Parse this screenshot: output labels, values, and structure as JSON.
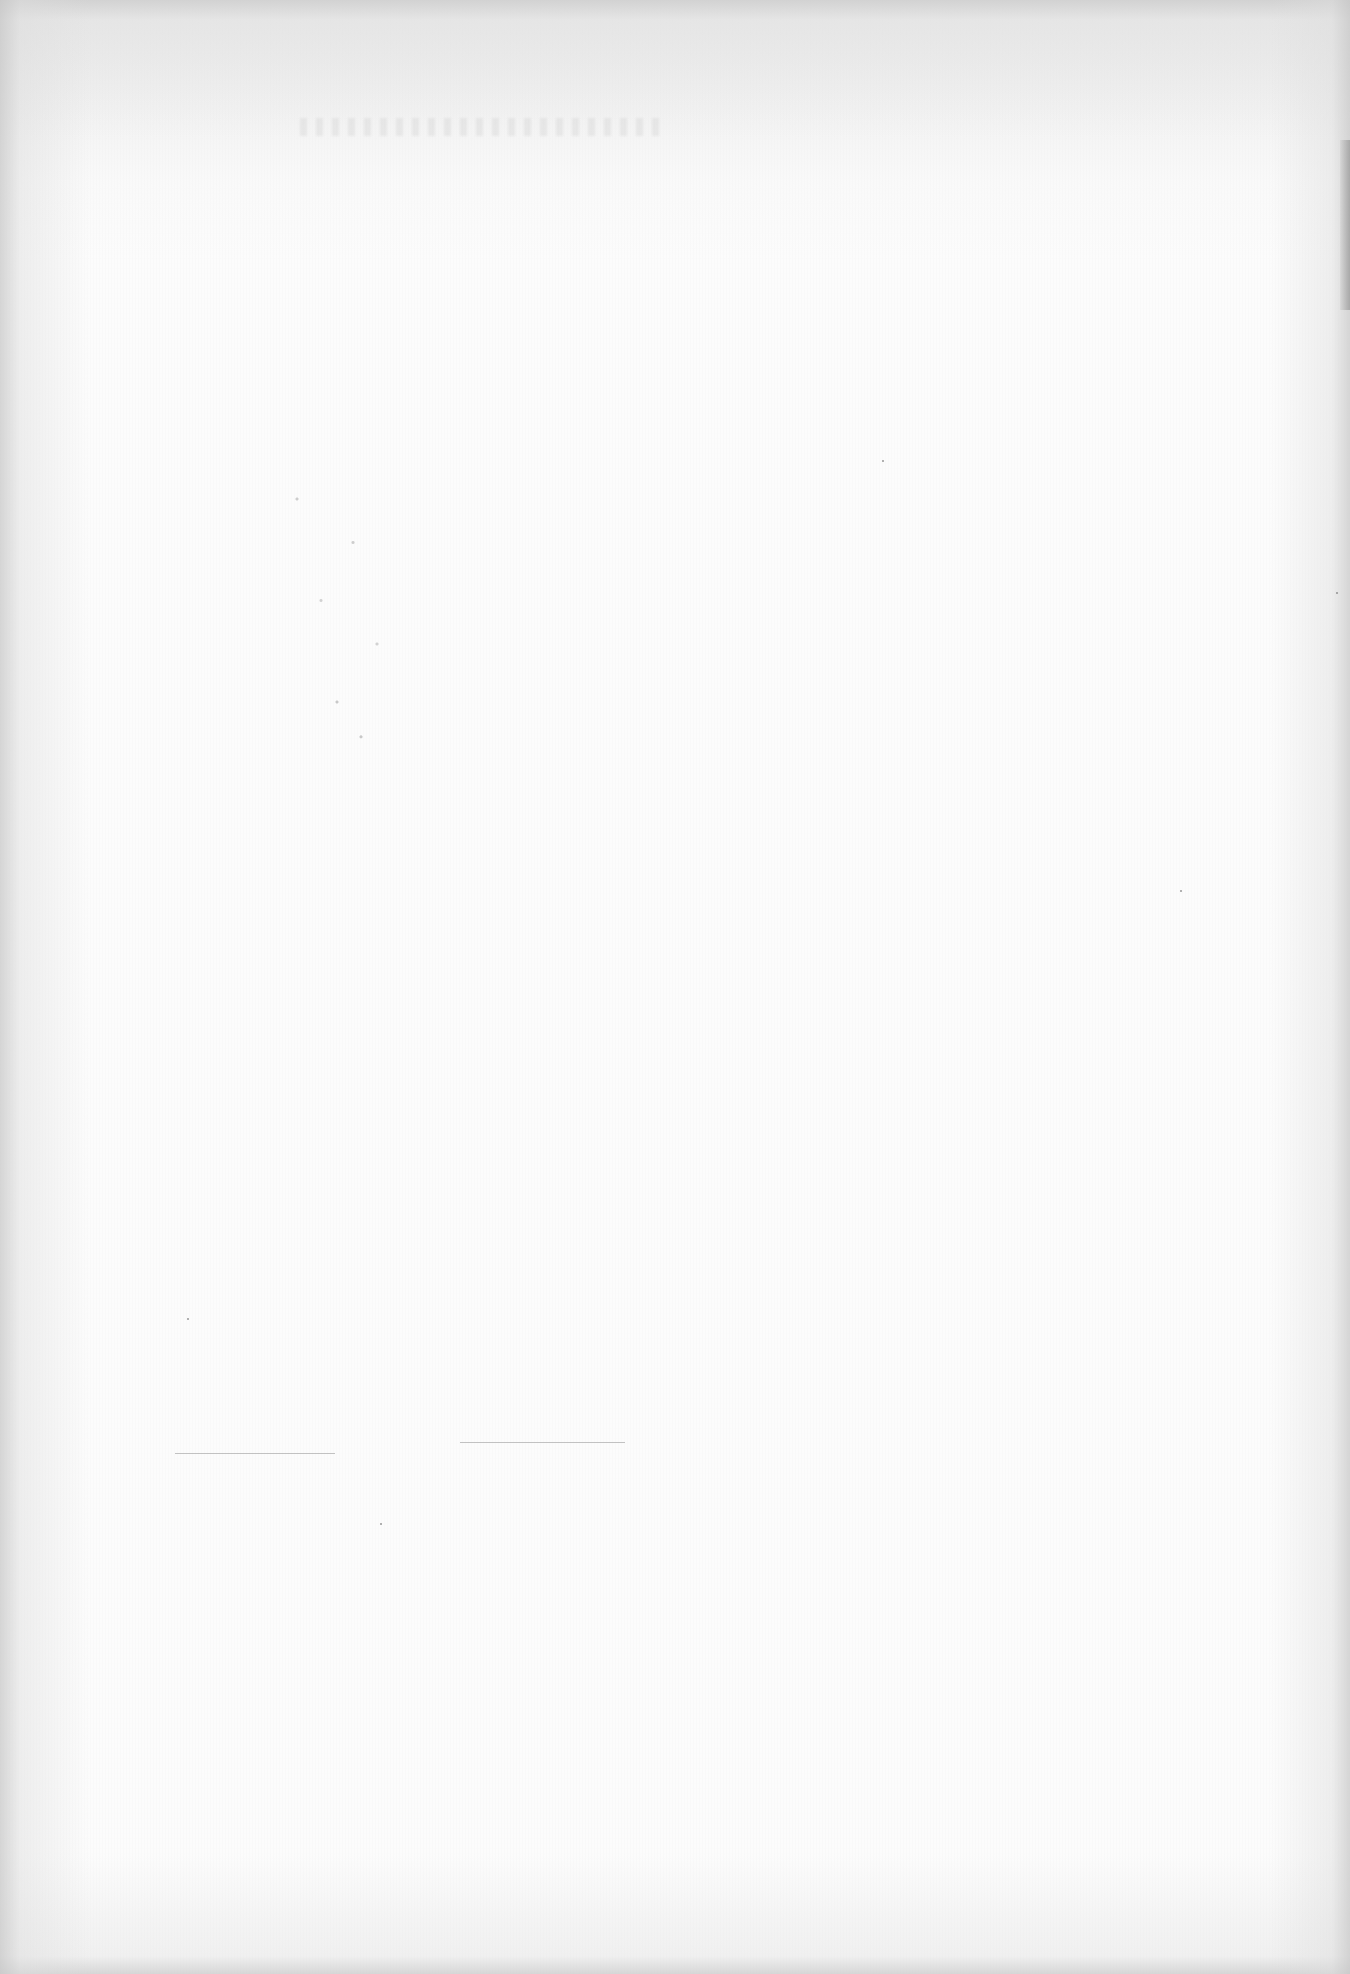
{
  "page": {
    "type": "blank scanned page",
    "background_color": "#fcfcfc",
    "edge_shade_color": "#cfcfcf",
    "text_content": []
  },
  "marks": {
    "bleed_through": {
      "legible": false
    },
    "rules": [
      {
        "name": "faint-rule-left",
        "x": 175,
        "y": 1453,
        "width": 160
      },
      {
        "name": "faint-rule-right",
        "x": 460,
        "y": 1442,
        "width": 165
      }
    ]
  }
}
